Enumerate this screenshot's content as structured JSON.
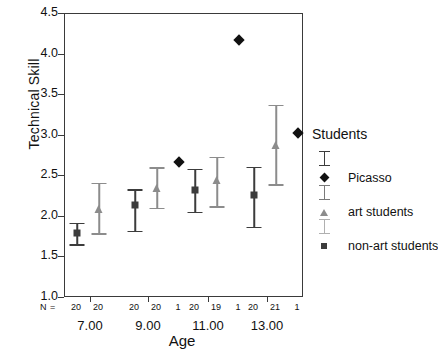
{
  "chart_data": {
    "type": "scatter",
    "title": "",
    "xlabel": "Age",
    "ylabel": "Technical Skill",
    "ylim": [
      1.0,
      4.5
    ],
    "yticks": [
      "1.0",
      "1.5",
      "2.0",
      "2.5",
      "3.0",
      "3.5",
      "4.0",
      "4.5"
    ],
    "ytick_values": [
      1.0,
      1.5,
      2.0,
      2.5,
      3.0,
      3.5,
      4.0,
      4.5
    ],
    "grid": false,
    "categories": [
      "7.00",
      "9.00",
      "11.00",
      "13.00"
    ],
    "n_prefix": "N =",
    "legend_title": "Students",
    "legend_position": "right",
    "series": [
      {
        "name": "non-art students",
        "marker": "square",
        "color": "#3c3c3c",
        "values": [
          1.8,
          2.14,
          2.33,
          2.27
        ],
        "lower": [
          1.66,
          1.83,
          2.06,
          1.88
        ],
        "upper": [
          1.93,
          2.34,
          2.59,
          2.62
        ],
        "n": [
          20,
          20,
          20,
          20
        ]
      },
      {
        "name": "art students",
        "marker": "triangle",
        "color": "#8c8c8c",
        "values": [
          2.1,
          2.36,
          2.45,
          2.89
        ],
        "lower": [
          1.8,
          2.11,
          2.13,
          2.4
        ],
        "upper": [
          2.42,
          2.61,
          2.74,
          3.38
        ],
        "n": [
          20,
          20,
          19,
          21
        ]
      },
      {
        "name": "Picasso",
        "marker": "diamond",
        "color": "#111111",
        "values": [
          null,
          2.67,
          4.18,
          3.03
        ],
        "n": [
          null,
          1,
          1,
          1
        ]
      }
    ]
  },
  "legend": {
    "title": "Students",
    "entries": [
      {
        "label": "Picasso",
        "marker": "diamond",
        "color": "#111111",
        "bar_color": "#3c3c3c"
      },
      {
        "label": "art students",
        "marker": "triangle",
        "color": "#8c8c8c",
        "bar_color": "#7a7a7a"
      },
      {
        "label": "non-art students",
        "marker": "square",
        "color": "#3c3c3c",
        "bar_color": "#b0b0b0"
      }
    ]
  }
}
